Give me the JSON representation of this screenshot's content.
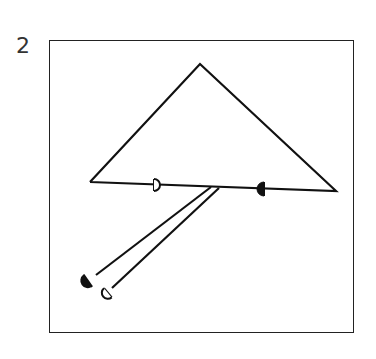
{
  "figure": {
    "label": "2",
    "stroke_color": "#111111",
    "background": "#ffffff"
  },
  "diagram": {
    "triangle": {
      "apex": [
        200,
        64
      ],
      "left_base": [
        90,
        182
      ],
      "right_base": [
        336,
        191
      ]
    },
    "base_markers": [
      {
        "type": "open-semicircle",
        "position": [
          157,
          185
        ],
        "direction": "right"
      },
      {
        "type": "filled-semicircle",
        "position": [
          261,
          189
        ],
        "direction": "left"
      }
    ],
    "branch_lines": [
      {
        "from": [
          211,
          187
        ],
        "to": [
          96,
          275
        ]
      },
      {
        "from": [
          219,
          188
        ],
        "to": [
          112,
          288
        ]
      }
    ],
    "branch_markers": [
      {
        "type": "filled-semicircle",
        "position": [
          84,
          283
        ]
      },
      {
        "type": "open-semicircle",
        "position": [
          103,
          298
        ]
      }
    ]
  }
}
